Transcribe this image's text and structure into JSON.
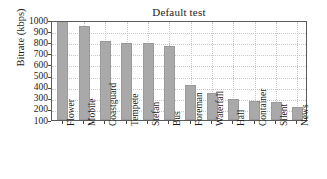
{
  "chart_data": {
    "type": "bar",
    "title": "Default test",
    "xlabel": "",
    "ylabel": "Bitrate (kbps)",
    "ylim": [
      100,
      1000
    ],
    "yticks": [
      1000,
      900,
      800,
      700,
      600,
      500,
      400,
      300,
      200,
      100
    ],
    "grid": true,
    "legend": null,
    "bar_color": "#a9a9a9",
    "categories": [
      "Flower",
      "Mobile",
      "Coastguard",
      "Tempete",
      "Stefan",
      "Bus",
      "Foreman",
      "Waterfall",
      "Hall",
      "Container",
      "Silent",
      "News"
    ],
    "values": [
      1000,
      945,
      810,
      795,
      790,
      770,
      415,
      340,
      293,
      268,
      263,
      215
    ]
  }
}
